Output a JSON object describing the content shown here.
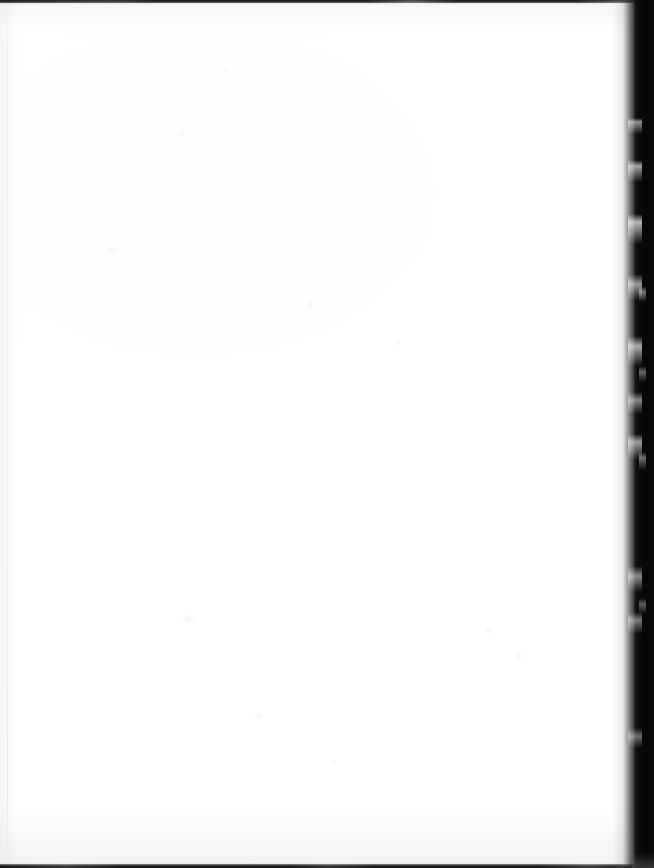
{
  "document": {
    "type": "scanned-page-image",
    "page_content": "",
    "page_state_label": "Blank page",
    "orientation": "portrait"
  },
  "canvas": {
    "width": 654,
    "height": 868,
    "background_color": "#ffffff"
  },
  "page_body": {
    "paper_color": "#ffffff",
    "text": "",
    "has_visible_text": false
  },
  "artifacts": {
    "top_edge_line": {
      "name": "top-scan-edge-line",
      "color": "#1a1a1a",
      "thickness_px": 4
    },
    "bottom_edge_line": {
      "name": "bottom-scan-edge-line",
      "color": "#111111",
      "thickness_px": 5
    },
    "right_gutter_band": {
      "name": "right-gutter-shadow-band",
      "color": "#070707",
      "width_px": 20,
      "edge_description": "ragged white-flecked boundary"
    },
    "left_margin_line": {
      "name": "left-margin-tone-line",
      "color": "#969696"
    }
  }
}
